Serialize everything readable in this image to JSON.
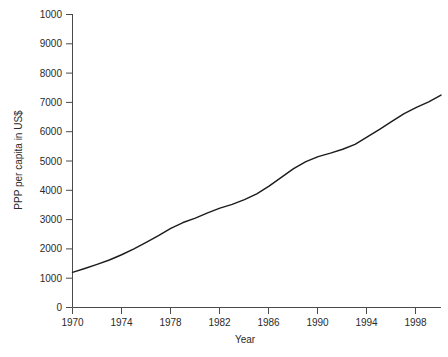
{
  "chart_data": {
    "type": "line",
    "title": "",
    "subtitle": "",
    "xlabel": "Year",
    "ylabel": "PPP per capita in US$",
    "xlim": [
      1970,
      2000
    ],
    "ylim": [
      0,
      10000
    ],
    "grid": false,
    "legend": null,
    "legend_position": "none",
    "x_tick_labels": [
      "1970",
      "1974",
      "1978",
      "1982",
      "1986",
      "1990",
      "1994",
      "1998"
    ],
    "x_tick_values": [
      1970,
      1974,
      1978,
      1982,
      1986,
      1990,
      1994,
      1998
    ],
    "y_tick_labels": [
      "1000",
      "9000",
      "8000",
      "7000",
      "6000",
      "5000",
      "4000",
      "3000",
      "2000",
      "1000",
      "0"
    ],
    "y_tick_values": [
      10000,
      9000,
      8000,
      7000,
      6000,
      5000,
      4000,
      3000,
      2000,
      1000,
      0
    ],
    "series": [
      {
        "name": "PPP per capita",
        "color": "#1c1c1c",
        "x": [
          1970,
          1971,
          1972,
          1973,
          1974,
          1975,
          1976,
          1977,
          1978,
          1979,
          1980,
          1981,
          1982,
          1983,
          1984,
          1985,
          1986,
          1987,
          1988,
          1989,
          1990,
          1991,
          1992,
          1993,
          1994,
          1995,
          1996,
          1997,
          1998,
          1999,
          2000
        ],
        "values": [
          1200,
          1330,
          1470,
          1620,
          1800,
          2000,
          2220,
          2450,
          2700,
          2900,
          3050,
          3230,
          3390,
          3520,
          3680,
          3880,
          4140,
          4440,
          4740,
          4980,
          5150,
          5270,
          5400,
          5570,
          5820,
          6080,
          6350,
          6620,
          6830,
          7020,
          7250
        ]
      }
    ]
  },
  "axis": {
    "x_title": "Year",
    "y_title": "PPP per capita in US$"
  },
  "colors": {
    "line": "#1c1c1c",
    "axis": "#4a4a4a",
    "text": "#2b2b2b",
    "background": "#ffffff"
  },
  "footer_artifact": {
    "text": ""
  }
}
